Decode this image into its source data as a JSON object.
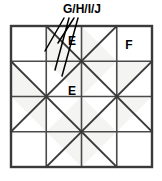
{
  "diagram": {
    "type": "geometric-quilt-block",
    "grid": {
      "rows": 4,
      "cols": 4,
      "left": 11,
      "top": 26,
      "cell": 35.25,
      "border_color": "#3a3a3a",
      "grid_line_color": "#4a4a4a",
      "diagonal_color": "#3a3a3a",
      "fill_light": "#f4f4f2",
      "background": "#ffffff"
    },
    "cells": [
      {
        "row": 0,
        "col": 0,
        "diagonal": "none",
        "shade": "none"
      },
      {
        "row": 0,
        "col": 1,
        "diagonal": "backslash",
        "shade": "lower-left"
      },
      {
        "row": 0,
        "col": 2,
        "diagonal": "slash",
        "shade": "lower-left"
      },
      {
        "row": 0,
        "col": 3,
        "diagonal": "none",
        "shade": "none"
      },
      {
        "row": 1,
        "col": 0,
        "diagonal": "backslash",
        "shade": "lower-left"
      },
      {
        "row": 1,
        "col": 1,
        "diagonal": "slash",
        "shade": "upper-right"
      },
      {
        "row": 1,
        "col": 2,
        "diagonal": "backslash",
        "shade": "upper-left"
      },
      {
        "row": 1,
        "col": 3,
        "diagonal": "slash",
        "shade": "upper-left"
      },
      {
        "row": 2,
        "col": 0,
        "diagonal": "slash",
        "shade": "upper-right"
      },
      {
        "row": 2,
        "col": 1,
        "diagonal": "backslash",
        "shade": "lower-right"
      },
      {
        "row": 2,
        "col": 2,
        "diagonal": "slash",
        "shade": "lower-left"
      },
      {
        "row": 2,
        "col": 3,
        "diagonal": "backslash",
        "shade": "upper-left"
      },
      {
        "row": 3,
        "col": 0,
        "diagonal": "none",
        "shade": "none"
      },
      {
        "row": 3,
        "col": 1,
        "diagonal": "slash",
        "shade": "upper-right"
      },
      {
        "row": 3,
        "col": 2,
        "diagonal": "backslash",
        "shade": "upper-left"
      },
      {
        "row": 3,
        "col": 3,
        "diagonal": "none",
        "shade": "none"
      }
    ],
    "labels": [
      {
        "id": "label-e-top",
        "text": "E",
        "x": 72,
        "y": 45
      },
      {
        "id": "label-e-middle",
        "text": "E",
        "x": 72,
        "y": 95
      },
      {
        "id": "label-f",
        "text": "F",
        "x": 129,
        "y": 49
      }
    ],
    "callout": {
      "id": "callout-ghij",
      "text": "G/H/I/J",
      "x": 82,
      "y": 13,
      "leader_lines": [
        {
          "id": "leader-1",
          "x1": 64,
          "y1": 18,
          "x2": 45,
          "y2": 51
        },
        {
          "id": "leader-2",
          "x1": 69,
          "y1": 18,
          "x2": 55,
          "y2": 70
        },
        {
          "id": "leader-3",
          "x1": 74,
          "y1": 18,
          "x2": 58,
          "y2": 43
        },
        {
          "id": "leader-4",
          "x1": 78,
          "y1": 18,
          "x2": 62,
          "y2": 76
        }
      ]
    }
  }
}
